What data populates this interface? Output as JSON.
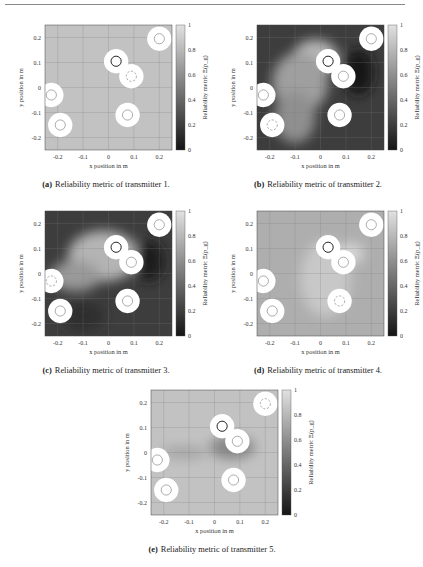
{
  "page": {
    "header_rule": true
  },
  "chart_data": [
    {
      "id": "a",
      "type": "heatmap",
      "title": "",
      "caption_label": "(a)",
      "caption_text": "Reliability metric of transmitter 1.",
      "xlabel": "x position in m",
      "ylabel": "y position in m",
      "colorbar_label": "Reliability metric Ξ(p_g)",
      "xlim": [
        -0.25,
        0.25
      ],
      "ylim": [
        -0.25,
        0.25
      ],
      "xticks": [
        "-0.2",
        "-0.1",
        "0",
        "0.1",
        "0.2"
      ],
      "yticks": [
        "0.2",
        "0.1",
        "0",
        "-0.1",
        "-0.2"
      ],
      "cticks": [
        "1",
        "0.8",
        "0.6",
        "0.4",
        "0.2",
        "0"
      ],
      "clim": [
        0,
        1
      ],
      "grid": true,
      "background_value": 0.85,
      "transmitter_index": 1,
      "nodes": [
        {
          "x": 0.03,
          "y": 0.105,
          "style": "dark"
        },
        {
          "x": 0.09,
          "y": 0.045,
          "style": "dashed"
        },
        {
          "x": 0.2,
          "y": 0.195,
          "style": "normal"
        },
        {
          "x": -0.225,
          "y": -0.03,
          "style": "normal"
        },
        {
          "x": -0.19,
          "y": -0.15,
          "style": "normal"
        },
        {
          "x": 0.075,
          "y": -0.11,
          "style": "normal"
        }
      ]
    },
    {
      "id": "b",
      "type": "heatmap",
      "caption_label": "(b)",
      "caption_text": "Reliability metric of transmitter 2.",
      "xlabel": "x position in m",
      "ylabel": "y position in m",
      "colorbar_label": "Reliability metric Ξ(p_g)",
      "xlim": [
        -0.25,
        0.25
      ],
      "ylim": [
        -0.25,
        0.25
      ],
      "xticks": [
        "-0.2",
        "-0.1",
        "0",
        "0.1",
        "0.2"
      ],
      "yticks": [
        "0.2",
        "0.1",
        "0",
        "-0.1",
        "-0.2"
      ],
      "cticks": [
        "1",
        "0.8",
        "0.6",
        "0.4",
        "0.2",
        "0"
      ],
      "clim": [
        0,
        1
      ],
      "grid": true,
      "background_value": 0.2,
      "transmitter_index": 2,
      "nodes": [
        {
          "x": 0.03,
          "y": 0.105,
          "style": "dark"
        },
        {
          "x": 0.09,
          "y": 0.045,
          "style": "normal"
        },
        {
          "x": 0.2,
          "y": 0.195,
          "style": "normal"
        },
        {
          "x": -0.225,
          "y": -0.03,
          "style": "normal"
        },
        {
          "x": -0.19,
          "y": -0.15,
          "style": "dashed"
        },
        {
          "x": 0.075,
          "y": -0.11,
          "style": "normal"
        }
      ]
    },
    {
      "id": "c",
      "type": "heatmap",
      "caption_label": "(c)",
      "caption_text": "Reliability metric of transmitter 3.",
      "xlabel": "x position in m",
      "ylabel": "y position in m",
      "colorbar_label": "Reliability metric Ξ(p_g)",
      "xlim": [
        -0.25,
        0.25
      ],
      "ylim": [
        -0.25,
        0.25
      ],
      "xticks": [
        "-0.2",
        "-0.1",
        "0",
        "0.1",
        "0.2"
      ],
      "yticks": [
        "0.2",
        "0.1",
        "0",
        "-0.1",
        "-0.2"
      ],
      "cticks": [
        "1",
        "0.8",
        "0.6",
        "0.4",
        "0.2",
        "0"
      ],
      "clim": [
        0,
        1
      ],
      "grid": true,
      "background_value": 0.2,
      "transmitter_index": 3,
      "nodes": [
        {
          "x": 0.03,
          "y": 0.105,
          "style": "dark"
        },
        {
          "x": 0.09,
          "y": 0.045,
          "style": "normal"
        },
        {
          "x": 0.2,
          "y": 0.195,
          "style": "normal"
        },
        {
          "x": -0.225,
          "y": -0.03,
          "style": "dashed"
        },
        {
          "x": -0.19,
          "y": -0.15,
          "style": "normal"
        },
        {
          "x": 0.075,
          "y": -0.11,
          "style": "normal"
        }
      ]
    },
    {
      "id": "d",
      "type": "heatmap",
      "caption_label": "(d)",
      "caption_text": "Reliability metric of transmitter 4.",
      "xlabel": "x position in m",
      "ylabel": "y position in m",
      "colorbar_label": "Reliability metric Ξ(p_g)",
      "xlim": [
        -0.25,
        0.25
      ],
      "ylim": [
        -0.25,
        0.25
      ],
      "xticks": [
        "-0.2",
        "-0.1",
        "0",
        "0.1",
        "0.2"
      ],
      "yticks": [
        "0.2",
        "0.1",
        "0",
        "-0.1",
        "-0.2"
      ],
      "cticks": [
        "1",
        "0.8",
        "0.6",
        "0.4",
        "0.2",
        "0"
      ],
      "clim": [
        0,
        1
      ],
      "grid": true,
      "background_value": 0.75,
      "transmitter_index": 4,
      "nodes": [
        {
          "x": 0.03,
          "y": 0.105,
          "style": "dark"
        },
        {
          "x": 0.09,
          "y": 0.045,
          "style": "normal"
        },
        {
          "x": 0.2,
          "y": 0.195,
          "style": "normal"
        },
        {
          "x": -0.225,
          "y": -0.03,
          "style": "normal"
        },
        {
          "x": -0.19,
          "y": -0.15,
          "style": "normal"
        },
        {
          "x": 0.075,
          "y": -0.11,
          "style": "dashed"
        }
      ]
    },
    {
      "id": "e",
      "type": "heatmap",
      "caption_label": "(e)",
      "caption_text": "Reliability metric of transmitter 5.",
      "xlabel": "x position in m",
      "ylabel": "y position in m",
      "colorbar_label": "Reliability metric Ξ(p_g)",
      "xlim": [
        -0.25,
        0.25
      ],
      "ylim": [
        -0.25,
        0.25
      ],
      "xticks": [
        "-0.2",
        "-0.1",
        "0",
        "0.1",
        "0.2"
      ],
      "yticks": [
        "0.2",
        "0.1",
        "0",
        "-0.1",
        "-0.2"
      ],
      "cticks": [
        "1",
        "0.8",
        "0.6",
        "0.4",
        "0.2",
        "0"
      ],
      "clim": [
        0,
        1
      ],
      "grid": true,
      "background_value": 0.85,
      "transmitter_index": 5,
      "nodes": [
        {
          "x": 0.03,
          "y": 0.105,
          "style": "dark"
        },
        {
          "x": 0.09,
          "y": 0.045,
          "style": "normal"
        },
        {
          "x": 0.2,
          "y": 0.195,
          "style": "dashed"
        },
        {
          "x": -0.225,
          "y": -0.03,
          "style": "normal"
        },
        {
          "x": -0.19,
          "y": -0.15,
          "style": "normal"
        },
        {
          "x": 0.075,
          "y": -0.11,
          "style": "normal"
        }
      ]
    }
  ],
  "colors": {
    "rule": "#888888",
    "grid": "#7a7a7a",
    "ring_fill": "#ffffff",
    "node_dark": "#222222",
    "node_normal": "#8a8a8a"
  }
}
